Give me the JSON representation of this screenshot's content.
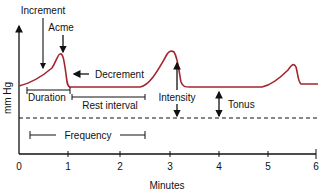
{
  "diagram": {
    "y_axis_label": "mm Hg",
    "x_axis_label": "Minutes",
    "x_ticks": [
      "0",
      "1",
      "2",
      "3",
      "4",
      "5",
      "6"
    ],
    "labels": {
      "increment": "Increment",
      "acme": "Acme",
      "decrement": "Decrement",
      "duration": "Duration",
      "rest_interval": "Rest interval",
      "intensity": "Intensity",
      "tonus": "Tonus",
      "frequency": "Frequency"
    },
    "colors": {
      "curve": "#a3262f",
      "axis": "#111111"
    }
  }
}
